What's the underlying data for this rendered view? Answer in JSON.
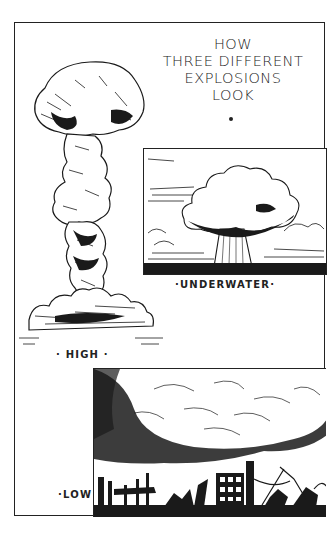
{
  "title": {
    "lines": [
      "HOW",
      "THREE DIFFERENT",
      "EXPLOSIONS",
      "LOOK"
    ],
    "bullet": "•"
  },
  "panels": {
    "high": {
      "caption": "· HIGH ·",
      "icon": "mushroom-cloud-tall"
    },
    "underwater": {
      "caption": "·UNDERWATER·",
      "icon": "underwater-blast-column"
    },
    "low": {
      "caption": "·LOW",
      "icon": "low-blast-over-ruined-city"
    }
  },
  "colors": {
    "ink": "#1a1a1a",
    "paper": "#ffffff"
  }
}
